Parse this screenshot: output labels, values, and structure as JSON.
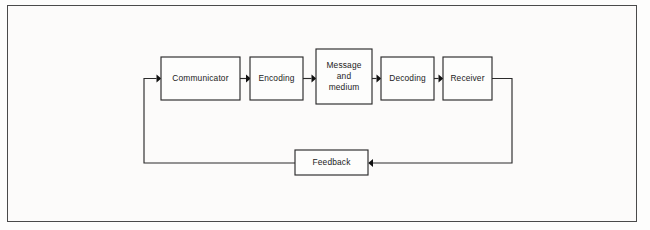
{
  "diagram": {
    "type": "flow-diagram",
    "background_color": "#fcfbfa",
    "line_color": "#2b2b2b",
    "text_color": "#1b1b1b",
    "frame": {
      "x": 7,
      "y": 5,
      "width": 630,
      "height": 217
    },
    "nodes": [
      {
        "id": "communicator",
        "label": "Communicator",
        "x": 161,
        "y": 57,
        "width": 79,
        "height": 43,
        "multiline": false
      },
      {
        "id": "encoding",
        "label": "Encoding",
        "x": 250,
        "y": 57,
        "width": 53,
        "height": 43,
        "multiline": false
      },
      {
        "id": "message-and-medium",
        "label": "Message\nand\nmedium",
        "x": 316,
        "y": 49,
        "width": 56,
        "height": 55,
        "multiline": true
      },
      {
        "id": "decoding",
        "label": "Decoding",
        "x": 381,
        "y": 57,
        "width": 53,
        "height": 43,
        "multiline": false
      },
      {
        "id": "receiver",
        "label": "Receiver",
        "x": 443,
        "y": 57,
        "width": 49,
        "height": 43,
        "multiline": false
      },
      {
        "id": "feedback",
        "label": "Feedback",
        "x": 295,
        "y": 150,
        "width": 73,
        "height": 25,
        "multiline": false
      }
    ],
    "connectors": [
      {
        "id": "communicator-to-encoding",
        "from": "communicator",
        "to": "encoding",
        "arrow": "right"
      },
      {
        "id": "encoding-to-message",
        "from": "encoding",
        "to": "message-and-medium",
        "arrow": "right"
      },
      {
        "id": "message-to-decoding",
        "from": "message-and-medium",
        "to": "decoding",
        "arrow": "right"
      },
      {
        "id": "decoding-to-receiver",
        "from": "decoding",
        "to": "receiver",
        "arrow": "right"
      },
      {
        "id": "receiver-to-feedback",
        "from": "receiver",
        "to": "feedback",
        "arrow": "left"
      },
      {
        "id": "feedback-to-communicator",
        "from": "feedback",
        "to": "communicator",
        "arrow": "right"
      }
    ]
  }
}
